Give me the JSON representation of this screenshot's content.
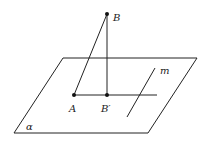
{
  "diagram": {
    "points": {
      "B": {
        "label": "B",
        "x": 107,
        "y": 14
      },
      "A": {
        "label": "A",
        "x": 74,
        "y": 95
      },
      "B_prime": {
        "label": "B′",
        "x": 107,
        "y": 95
      }
    },
    "plane": {
      "label": "α"
    },
    "line_m": {
      "label": "m"
    },
    "colors": {
      "stroke": "#222222",
      "background": "#ffffff"
    }
  }
}
